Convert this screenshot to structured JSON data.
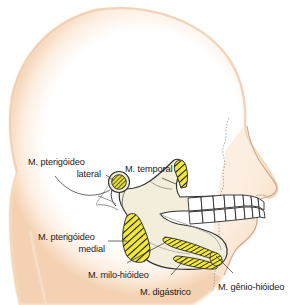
{
  "figure": {
    "type": "anatomical-illustration",
    "language": "pt-BR"
  },
  "colors": {
    "skin_outline": "#f6d9bd",
    "skin_fill": "#ffffff",
    "bone_fill": "#f3eedb",
    "bone_stroke": "#3a3a3a",
    "muscle_fill": "#f2e83c",
    "muscle_hatch": "#1a1a1a",
    "tooth_fill": "#ffffff",
    "label_text": "#1b1b1b",
    "leader_line": "#2b2b2b"
  },
  "labels": [
    {
      "id": "pterigoideo-lateral",
      "lines": [
        "M. pterigóideo",
        "lateral"
      ],
      "line1": "M. pterigóideo",
      "line2": "lateral",
      "align": "right",
      "points_to": "mandibular-condyle"
    },
    {
      "id": "temporal",
      "lines": [
        "M. temporal"
      ],
      "line1": "M. temporal",
      "align": "left",
      "points_to": "coronoid-process"
    },
    {
      "id": "pterigoideo-medial",
      "lines": [
        "M. pterigóideo",
        "medial"
      ],
      "line1": "M. pterigóideo",
      "line2": "medial",
      "align": "right",
      "points_to": "ramus-medial-surface"
    },
    {
      "id": "milo-hioideo",
      "lines": [
        "M. milo-hióideo"
      ],
      "line1": "M. milo-hióideo",
      "align": "left",
      "points_to": "mylohyoid-line"
    },
    {
      "id": "digastrico",
      "lines": [
        "M. digástrico"
      ],
      "line1": "M. digástrico",
      "align": "left",
      "points_to": "digastric-fossa"
    },
    {
      "id": "genio-hioideo",
      "lines": [
        "M. gênio-hióideo"
      ],
      "line1": "M. gênio-hióideo",
      "align": "left",
      "points_to": "genial-tubercle"
    }
  ],
  "structures": [
    {
      "id": "head-silhouette",
      "name": "head-profile-outline"
    },
    {
      "id": "mandible",
      "name": "mandible-bone"
    },
    {
      "id": "mandibular-condyle",
      "name": "condyle-lateral-pterygoid-attachment"
    },
    {
      "id": "coronoid-process",
      "name": "coronoid-temporalis-attachment"
    },
    {
      "id": "ramus-medial-surface",
      "name": "medial-pterygoid-attachment"
    },
    {
      "id": "mylohyoid-line",
      "name": "mylohyoid-attachment-band"
    },
    {
      "id": "digastric-fossa",
      "name": "digastric-attachment-band"
    },
    {
      "id": "genial-tubercle",
      "name": "geniohyoid-attachment"
    },
    {
      "id": "upper-teeth",
      "name": "maxillary-teeth-row",
      "count": 8
    },
    {
      "id": "lower-teeth",
      "name": "mandibular-teeth-row",
      "count": 8
    },
    {
      "id": "nose",
      "name": "nasal-profile"
    },
    {
      "id": "lips",
      "name": "lip-profile"
    }
  ]
}
